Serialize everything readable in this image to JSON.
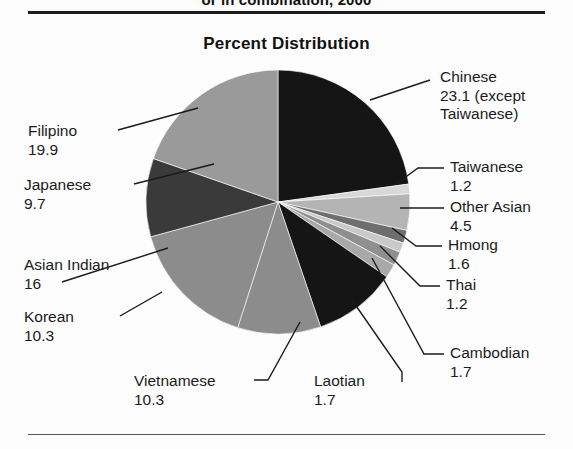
{
  "document": {
    "clipped_top_title": "or in combination, 2000",
    "chart_heading": "Percent Distribution"
  },
  "chart_data": {
    "type": "pie",
    "title": "Percent Distribution",
    "xlabel": "",
    "ylabel": "",
    "units": "percent",
    "start_angle_deg": 0,
    "direction": "clockwise",
    "legend_position": "callout-labels",
    "grid": false,
    "categories": [
      "Chinese (except Taiwanese)",
      "Taiwanese",
      "Other Asian",
      "Hmong",
      "Thai",
      "Cambodian",
      "Laotian",
      "Vietnamese",
      "Korean",
      "Asian Indian",
      "Japanese",
      "Filipino"
    ],
    "values": [
      23.1,
      1.2,
      4.5,
      1.6,
      1.2,
      1.7,
      1.7,
      10.3,
      10.3,
      16,
      9.7,
      19.9
    ],
    "colors": [
      "#151515",
      "#d8d8d8",
      "#b4b4b4",
      "#6e6e6e",
      "#c9c9c9",
      "#8f8f8f",
      "#a8a8a8",
      "#151515",
      "#8c8c8c",
      "#8c8c8c",
      "#3a3a3a",
      "#9a9a9a"
    ],
    "slices": [
      {
        "label": "Chinese",
        "value": 23.1,
        "note": "(except Taiwanese)",
        "color": "#151515"
      },
      {
        "label": "Taiwanese",
        "value": 1.2,
        "note": "",
        "color": "#d8d8d8"
      },
      {
        "label": "Other Asian",
        "value": 4.5,
        "note": "",
        "color": "#b4b4b4"
      },
      {
        "label": "Hmong",
        "value": 1.6,
        "note": "",
        "color": "#6e6e6e"
      },
      {
        "label": "Thai",
        "value": 1.2,
        "note": "",
        "color": "#c9c9c9"
      },
      {
        "label": "Cambodian",
        "value": 1.7,
        "note": "",
        "color": "#8f8f8f"
      },
      {
        "label": "Laotian",
        "value": 1.7,
        "note": "",
        "color": "#a8a8a8"
      },
      {
        "label": "Vietnamese",
        "value": 10.3,
        "note": "",
        "color": "#151515"
      },
      {
        "label": "Korean",
        "value": 10.3,
        "note": "",
        "color": "#8c8c8c"
      },
      {
        "label": "Asian Indian",
        "value": 16,
        "note": "",
        "color": "#8c8c8c"
      },
      {
        "label": "Japanese",
        "value": 9.7,
        "note": "",
        "color": "#3a3a3a"
      },
      {
        "label": "Filipino",
        "value": 19.9,
        "note": "",
        "color": "#9a9a9a"
      }
    ]
  },
  "labels": {
    "chinese": {
      "name": "Chinese",
      "value": "23.1 (except",
      "note": "Taiwanese)"
    },
    "taiwanese": {
      "name": "Taiwanese",
      "value": "1.2"
    },
    "other_asian": {
      "name": "Other Asian",
      "value": "4.5"
    },
    "hmong": {
      "name": "Hmong",
      "value": "1.6"
    },
    "thai": {
      "name": "Thai",
      "value": "1.2"
    },
    "cambodian": {
      "name": "Cambodian",
      "value": "1.7"
    },
    "laotian": {
      "name": "Laotian",
      "value": "1.7"
    },
    "vietnamese": {
      "name": "Vietnamese",
      "value": "10.3"
    },
    "korean": {
      "name": "Korean",
      "value": "10.3"
    },
    "asian_indian": {
      "name": "Asian Indian",
      "value": "16"
    },
    "japanese": {
      "name": "Japanese",
      "value": "9.7"
    },
    "filipino": {
      "name": "Filipino",
      "value": "19.9"
    }
  }
}
